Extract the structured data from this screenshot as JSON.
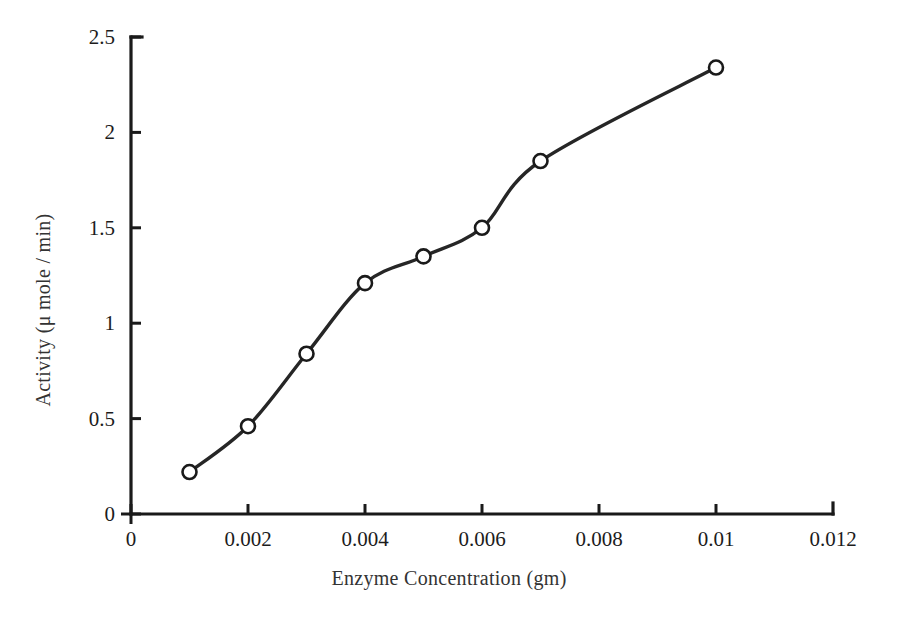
{
  "chart_data": {
    "type": "line",
    "title": "",
    "xlabel": "Enzyme Concentration (gm)",
    "ylabel": "Activity (μ mole / min)",
    "x": [
      0.001,
      0.002,
      0.003,
      0.004,
      0.005,
      0.006,
      0.007,
      0.01
    ],
    "values": [
      0.22,
      0.46,
      0.84,
      1.21,
      1.35,
      1.5,
      1.85,
      2.34
    ],
    "series": [
      {
        "name": "Activity",
        "values": [
          0.22,
          0.46,
          0.84,
          1.21,
          1.35,
          1.5,
          1.85,
          2.34
        ]
      }
    ],
    "xlim": [
      0,
      0.012
    ],
    "ylim": [
      0,
      2.5
    ],
    "xticks": [
      0,
      0.002,
      0.004,
      0.006,
      0.008,
      0.01,
      0.012
    ],
    "xtick_labels": [
      "0",
      "0.002",
      "0.004",
      "0.006",
      "0.008",
      "0.01",
      "0.012"
    ],
    "yticks": [
      0,
      0.5,
      1,
      1.5,
      2,
      2.5
    ],
    "ytick_labels": [
      "0",
      "0.5",
      "1",
      "1.5",
      "2",
      "2.5"
    ],
    "grid": false,
    "legend": false,
    "marker": "circle-open",
    "line_color": "#262626",
    "marker_face_color": "#ffffff",
    "marker_edge_color": "#1a1a1a",
    "background_color": "#ffffff"
  },
  "axis": {
    "x_title": "Enzyme Concentration (gm)",
    "y_title": "Activity (μ mole / min)"
  }
}
